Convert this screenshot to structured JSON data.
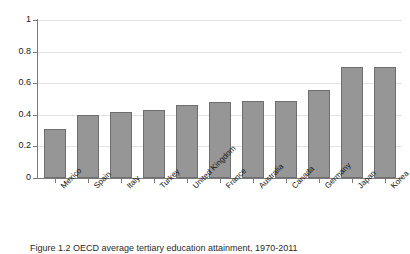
{
  "chart_data": {
    "type": "bar",
    "title": "",
    "subtitle": "",
    "xlabel": "",
    "ylabel": "",
    "ylim": [
      0,
      1
    ],
    "yticks": [
      "0",
      "0.2",
      "0.4",
      "0.6",
      "0.8",
      "1"
    ],
    "ytick_values": [
      0,
      0.2,
      0.4,
      0.6,
      0.8,
      1
    ],
    "grid": true,
    "legend": false,
    "legend_position": "none",
    "bar_color": "#969696",
    "bar_edge_color": "#6e6e6e",
    "axis_color": "#7a7a7a",
    "grid_color": "#e4e4e4",
    "categories": [
      "Mexico",
      "Spain",
      "Italy",
      "Turkey",
      "United Kingdom",
      "France",
      "Australia",
      "Canada",
      "Germany",
      "Japan",
      "Korea"
    ],
    "values": [
      0.31,
      0.4,
      0.42,
      0.43,
      0.46,
      0.48,
      0.49,
      0.49,
      0.56,
      0.7,
      0.7
    ]
  },
  "caption": {
    "text": "Figure 1.2 OECD average tertiary education attainment, 1970-2011"
  }
}
